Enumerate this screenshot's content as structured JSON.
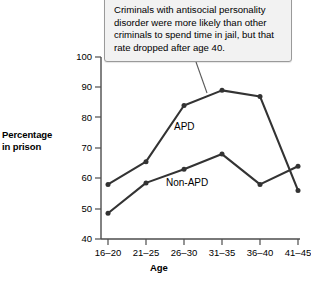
{
  "chart_data": {
    "type": "line",
    "title": "",
    "xlabel": "Age",
    "ylabel": "Percentage in prison",
    "categories": [
      "16–20",
      "21–25",
      "26–30",
      "31–35",
      "36–40",
      "41–45"
    ],
    "ylim": [
      40,
      100
    ],
    "yticks": [
      40,
      50,
      60,
      70,
      80,
      90,
      100
    ],
    "ytick_labels": [
      "40",
      "50",
      "60",
      "70",
      "80",
      "90",
      "100"
    ],
    "grid": false,
    "legend_position": "inline-labels",
    "series": [
      {
        "name": "APD",
        "values": [
          58,
          65.5,
          84,
          89,
          87,
          56
        ],
        "color": "#333333",
        "marker": "circle"
      },
      {
        "name": "Non-APD",
        "values": [
          48.5,
          58.5,
          63,
          68,
          58,
          64
        ],
        "color": "#333333",
        "marker": "circle"
      }
    ],
    "annotations": [
      {
        "name": "callout",
        "text": "Criminals with antisocial personality disorder were more likely than other criminals to spend time in jail, but that rate dropped after age 40.",
        "points_to_series": "APD",
        "points_to_category": "31–35"
      }
    ]
  },
  "labels": {
    "y_axis_title_line1": "Percentage",
    "y_axis_title_line2": "in prison",
    "x_axis_title": "Age",
    "series_apd": "APD",
    "series_nonapd": "Non-APD"
  },
  "colors": {
    "line": "#333333",
    "axis": "#4d4d4d",
    "callout_bg": "#f2f2f2",
    "callout_border": "#9a9a9a",
    "text": "#000000"
  }
}
